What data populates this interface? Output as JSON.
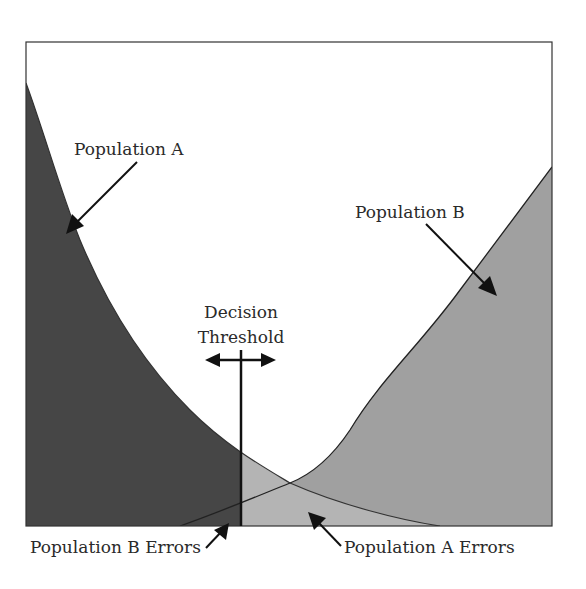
{
  "diagram": {
    "type": "overlapping-distributions",
    "labels": {
      "population_a": "Population A",
      "population_b": "Population B",
      "threshold_line1": "Decision",
      "threshold_line2": "Threshold",
      "population_b_errors": "Population B Errors",
      "population_a_errors": "Population A Errors"
    },
    "colors": {
      "population_a_fill": "#464646",
      "population_b_fill": "#a0a0a0",
      "overlap_fill": "#b4b4b4",
      "frame": "#333333",
      "background": "#ffffff"
    }
  }
}
